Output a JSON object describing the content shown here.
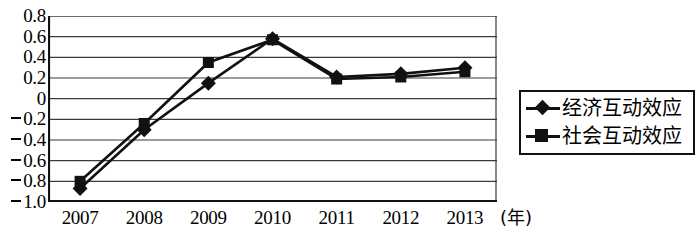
{
  "chart_data": {
    "type": "line",
    "title": "",
    "xlabel": "(年)",
    "ylabel": "",
    "categories": [
      "2007",
      "2008",
      "2009",
      "2010",
      "2011",
      "2012",
      "2013"
    ],
    "ylim": [
      -1.0,
      0.8
    ],
    "ytick_values": [
      0.8,
      0.6,
      0.4,
      0.2,
      0,
      -0.2,
      -0.4,
      -0.6,
      -0.8,
      -1.0
    ],
    "ytick_labels": [
      "0.8",
      "0.6",
      "0.4",
      "0.2",
      "0",
      "-0.2",
      "-0.4",
      "-0.6",
      "-0.8",
      "-1.0"
    ],
    "grid": true,
    "legend_position": "right",
    "series": [
      {
        "name": "经济互动效应",
        "marker": "diamond",
        "color": "#111111",
        "values": [
          -0.87,
          -0.3,
          0.15,
          0.58,
          0.21,
          0.24,
          0.3
        ]
      },
      {
        "name": "社会互动效应",
        "marker": "square",
        "color": "#111111",
        "values": [
          -0.8,
          -0.24,
          0.35,
          0.57,
          0.19,
          0.21,
          0.26
        ]
      }
    ]
  },
  "axes": {
    "y_labels": [
      {
        "text": "0.8",
        "negative": false,
        "value": 0.8
      },
      {
        "text": "0.6",
        "negative": false,
        "value": 0.6
      },
      {
        "text": "0.4",
        "negative": false,
        "value": 0.4
      },
      {
        "text": "0.2",
        "negative": false,
        "value": 0.2
      },
      {
        "text": "0",
        "negative": false,
        "value": 0
      },
      {
        "text": "0.2",
        "negative": true,
        "value": -0.2
      },
      {
        "text": "0.4",
        "negative": true,
        "value": -0.4
      },
      {
        "text": "0.6",
        "negative": true,
        "value": -0.6
      },
      {
        "text": "0.8",
        "negative": true,
        "value": -0.8
      },
      {
        "text": "1.0",
        "negative": true,
        "value": -1.0
      }
    ],
    "x_labels": [
      "2007",
      "2008",
      "2009",
      "2010",
      "2011",
      "2012",
      "2013"
    ],
    "x_unit": "(年)"
  },
  "legend": {
    "entries": [
      {
        "label": "经济互动效应",
        "marker": "diamond"
      },
      {
        "label": "社会互动效应",
        "marker": "square"
      }
    ]
  }
}
